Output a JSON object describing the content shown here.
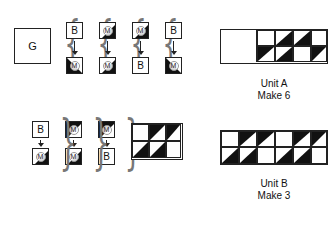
{
  "legend_top": {
    "large_square_label": "G",
    "pairs": [
      {
        "top": "B",
        "bottom": "M"
      },
      {
        "top": "M",
        "bottom": "M"
      },
      {
        "top": "M",
        "bottom": "B"
      },
      {
        "top": "B",
        "bottom": "M"
      }
    ]
  },
  "legend_bottom": {
    "pairs": [
      {
        "top": "B",
        "bottom": "M"
      },
      {
        "top": "M",
        "bottom": "M"
      },
      {
        "top": "M",
        "bottom": "B"
      }
    ]
  },
  "unit_a": {
    "title": "Unit A",
    "quantity": "Make 6",
    "large_square": "G",
    "rows": [
      [
        "white",
        "hst-br",
        "hst-br",
        "white"
      ],
      [
        "hst-tl",
        "hst-br",
        "white",
        "hst-tl"
      ]
    ]
  },
  "bottom_block": {
    "rows": [
      [
        "white",
        "hst-tl",
        "hst-tl"
      ],
      [
        "hst-br",
        "hst-br",
        "white"
      ]
    ]
  },
  "unit_b": {
    "title": "Unit B",
    "quantity": "Make 3",
    "rows": [
      [
        "white",
        "hst-tl",
        "hst-tl",
        "white",
        "hst-tl",
        "hst-tl"
      ],
      [
        "hst-br",
        "hst-br",
        "white",
        "hst-br",
        "hst-br",
        "white"
      ]
    ]
  },
  "colors": {
    "dark": "#111111",
    "light": "#ffffff",
    "outline": "#222222"
  }
}
